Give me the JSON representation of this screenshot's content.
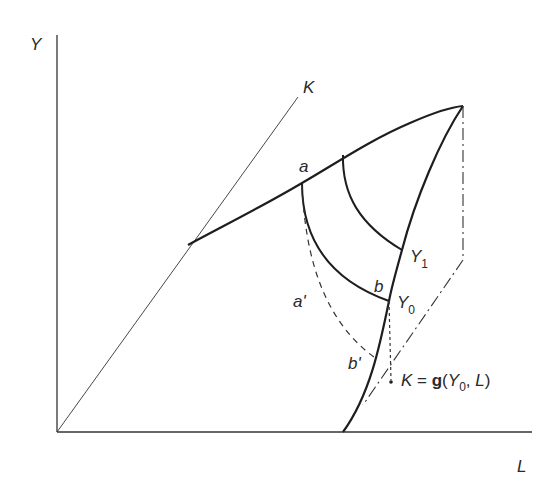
{
  "diagram": {
    "axes": {
      "y_label": "Y",
      "x_label": "L"
    },
    "ray_label": "K",
    "points": {
      "a": "a",
      "a_prime": "a'",
      "b": "b",
      "b_prime": "b'"
    },
    "curves": {
      "y1_label": "Y",
      "y1_sub": "1",
      "y0_label": "Y",
      "y0_sub": "0"
    },
    "equation": {
      "lhs": "K",
      "eq": " = ",
      "func": "g",
      "open": "(",
      "arg1": "Y",
      "arg1_sub": "0",
      "sep": ", ",
      "arg2": "L",
      "close": ")"
    },
    "colors": {
      "line": "#1e1e1e",
      "text": "#2a2a2a"
    }
  }
}
